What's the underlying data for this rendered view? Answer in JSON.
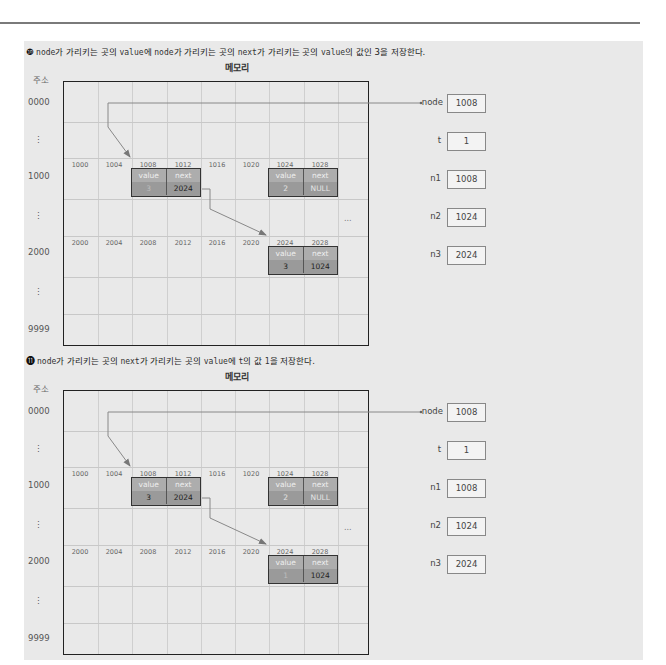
{
  "header": {
    "rule": true
  },
  "sections": [
    {
      "step_number": "❿",
      "caption_parts": [
        {
          "code": "node"
        },
        {
          "text": "가 가리키는 곳의 "
        },
        {
          "code": "value"
        },
        {
          "text": "에 "
        },
        {
          "code": "node"
        },
        {
          "text": "가 가리키는 곳의 "
        },
        {
          "code": "next"
        },
        {
          "text": "가 가리키는 곳의 "
        },
        {
          "code": "value"
        },
        {
          "text": "의 값인 3을 저장한다."
        }
      ],
      "memory_title": "메모리",
      "address_title": "주소",
      "row_labels": [
        "0000",
        "⋮",
        "1000",
        "⋮",
        "2000",
        "⋮",
        "9999"
      ],
      "row1_addresses": [
        "1000",
        "1004",
        "1008",
        "1012",
        "1016",
        "1020",
        "1024",
        "1028"
      ],
      "row2_addresses": [
        "2000",
        "2004",
        "2008",
        "2012",
        "2016",
        "2020",
        "2024",
        "2028"
      ],
      "ellipsis": "...",
      "cells": {
        "n1": {
          "value_label": "value",
          "next_label": "next",
          "value": "3",
          "next": "2024"
        },
        "n2": {
          "value_label": "value",
          "next_label": "next",
          "value": "2",
          "next": "NULL"
        },
        "n3": {
          "value_label": "value",
          "next_label": "next",
          "value": "3",
          "next": "1024"
        }
      },
      "variables": [
        {
          "name": "node",
          "value": "1008"
        },
        {
          "name": "t",
          "value": "1"
        },
        {
          "name": "n1",
          "value": "1008"
        },
        {
          "name": "n2",
          "value": "1024"
        },
        {
          "name": "n3",
          "value": "2024"
        }
      ]
    },
    {
      "step_number": "⓫",
      "caption_parts": [
        {
          "code": "node"
        },
        {
          "text": "가 가리키는 곳의 "
        },
        {
          "code": "next"
        },
        {
          "text": "가 가리키는 곳의 "
        },
        {
          "code": "value"
        },
        {
          "text": "에 "
        },
        {
          "code": "t"
        },
        {
          "text": "의 값 "
        },
        {
          "code": "1"
        },
        {
          "text": "을 저장한다."
        }
      ],
      "memory_title": "메모리",
      "address_title": "주소",
      "row_labels": [
        "0000",
        "⋮",
        "1000",
        "⋮",
        "2000",
        "⋮",
        "9999"
      ],
      "row1_addresses": [
        "1000",
        "1004",
        "1008",
        "1012",
        "1016",
        "1020",
        "1024",
        "1028"
      ],
      "row2_addresses": [
        "2000",
        "2004",
        "2008",
        "2012",
        "2016",
        "2020",
        "2024",
        "2028"
      ],
      "ellipsis": "...",
      "cells": {
        "n1": {
          "value_label": "value",
          "next_label": "next",
          "value": "3",
          "next": "2024"
        },
        "n2": {
          "value_label": "value",
          "next_label": "next",
          "value": "2",
          "next": "NULL"
        },
        "n3": {
          "value_label": "value",
          "next_label": "next",
          "value": "1",
          "next": "1024"
        }
      },
      "variables": [
        {
          "name": "node",
          "value": "1008"
        },
        {
          "name": "t",
          "value": "1"
        },
        {
          "name": "n1",
          "value": "1008"
        },
        {
          "name": "n2",
          "value": "1024"
        },
        {
          "name": "n3",
          "value": "2024"
        }
      ]
    }
  ],
  "colors": {
    "panel_bg": "#e9e9e9",
    "cell_header": "#adadad",
    "cell_value": "#9a9a9a",
    "arrow": "#777777",
    "border": "#222222"
  }
}
